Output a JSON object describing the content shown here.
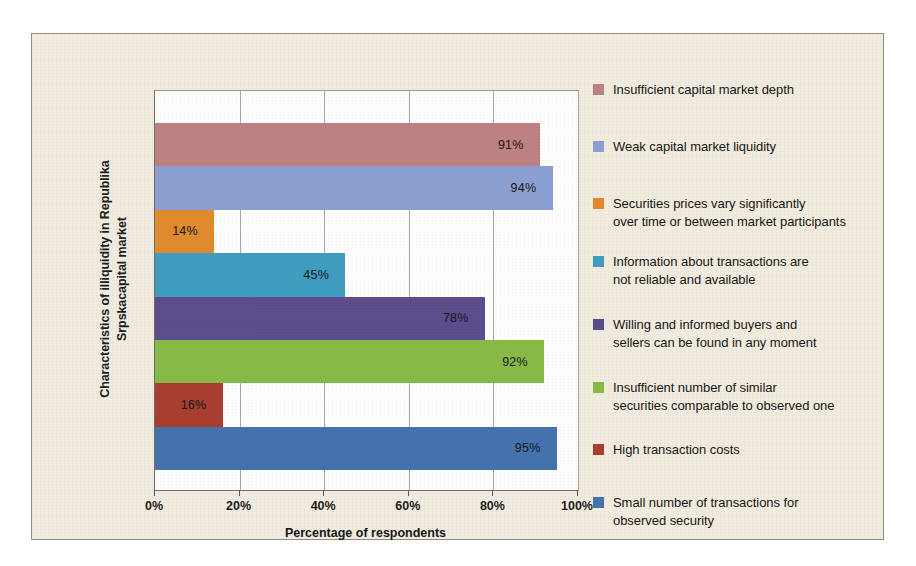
{
  "chart_data": {
    "type": "bar",
    "orientation": "horizontal",
    "title": "",
    "xlabel": "Percentage of respondents",
    "ylabel": "Characteristics of illiquidity in Republika\nSrpskacapital market",
    "xlim": [
      0,
      100
    ],
    "xticks": [
      "0%",
      "20%",
      "40%",
      "60%",
      "80%",
      "100%"
    ],
    "xtick_values": [
      0,
      20,
      40,
      60,
      80,
      100
    ],
    "grid": true,
    "grid_axis": "x",
    "legend_position": "right",
    "categories": [
      "Insufficient capital market depth",
      "Weak capital market liquidity",
      "Securities prices vary significantly over time or between market participants",
      "Information about transactions are not reliable and available",
      "Willing and informed buyers and sellers can be found in any moment",
      "Insufficient number of similar securities comparable to observed one",
      "High transaction costs",
      "Small number of transactions for observed security"
    ],
    "values": [
      91,
      94,
      14,
      45,
      78,
      92,
      16,
      95
    ],
    "value_labels": [
      "91%",
      "94%",
      "14%",
      "45%",
      "78%",
      "92%",
      "16%",
      "95%"
    ],
    "colors": [
      "#bf8082",
      "#8ba0d2",
      "#e18a2c",
      "#3e9cc0",
      "#5a4b8c",
      "#85bb45",
      "#a93c2e",
      "#4271ae"
    ]
  },
  "legend": {
    "items": [
      {
        "label": "Insufficient capital market depth",
        "color": "#bf8082",
        "top": 0
      },
      {
        "label": "Weak capital market liquidity",
        "color": "#8ba0d2",
        "top": 57
      },
      {
        "label": "Securities prices vary significantly\nover time or between market participants",
        "color": "#e18a2c",
        "top": 114
      },
      {
        "label": "Information about transactions are\nnot reliable and available",
        "color": "#3e9cc0",
        "top": 172
      },
      {
        "label": "Willing and informed buyers and\nsellers can be found in any moment",
        "color": "#5a4b8c",
        "top": 235
      },
      {
        "label": "Insufficient number of similar\nsecurities comparable to observed one",
        "color": "#85bb45",
        "top": 298
      },
      {
        "label": "High transaction costs",
        "color": "#a93c2e",
        "top": 360
      },
      {
        "label": "Small number of transactions for\nobserved security",
        "color": "#4271ae",
        "top": 413
      }
    ]
  },
  "theme": {
    "paper_background": "#f2ece0",
    "plot_background": "#ffffff",
    "border_color": "#8e8d86",
    "grid_color": "#a9a8a3",
    "text_color": "#141414"
  }
}
